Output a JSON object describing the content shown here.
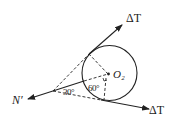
{
  "diagram": {
    "type": "force-diagram",
    "colors": {
      "stroke": "#222222",
      "background": "#ffffff"
    },
    "labels": {
      "tension_top": "ΔT",
      "tension_bottom": "ΔT",
      "normal_force": "N′",
      "center": "O₂",
      "angle_30": "30°",
      "angle_30b": "30°",
      "angle_60": "60°"
    },
    "elements": {
      "circle": {
        "cx": 109.5,
        "cy": 73,
        "r": 27.5
      },
      "vertex": {
        "x": 53,
        "y": 91
      }
    }
  }
}
